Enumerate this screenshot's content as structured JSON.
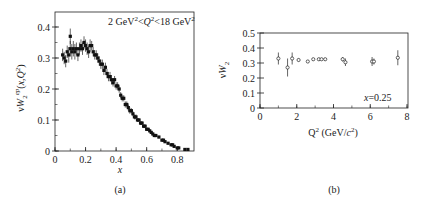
{
  "chart_data": [
    {
      "panel": "(a)",
      "type": "scatter",
      "title": "",
      "annotation": "2 GeV²<Q²<18 GeV²",
      "xlabel": "x",
      "ylabel": "νW₂^ep(x,Q²)",
      "xlim": [
        0,
        0.9
      ],
      "ylim": [
        0,
        0.44
      ],
      "xticks": [
        0,
        0.2,
        0.4,
        0.6,
        0.8
      ],
      "xtick_labels": [
        "0",
        "0.2",
        "0.4",
        "0.6",
        "0.8"
      ],
      "yticks": [
        0,
        0.1,
        0.2,
        0.3,
        0.4
      ],
      "ytick_labels": [
        "0",
        "0.1",
        "0.2",
        "0.3",
        "0.4"
      ],
      "grid": false,
      "series": [
        {
          "name": "νW2 ep",
          "x": [
            0.05,
            0.06,
            0.07,
            0.08,
            0.09,
            0.1,
            0.1,
            0.11,
            0.12,
            0.13,
            0.14,
            0.15,
            0.16,
            0.17,
            0.18,
            0.19,
            0.2,
            0.21,
            0.22,
            0.23,
            0.24,
            0.25,
            0.26,
            0.27,
            0.28,
            0.29,
            0.3,
            0.31,
            0.32,
            0.33,
            0.34,
            0.35,
            0.36,
            0.37,
            0.38,
            0.39,
            0.4,
            0.41,
            0.42,
            0.43,
            0.44,
            0.45,
            0.46,
            0.47,
            0.48,
            0.49,
            0.5,
            0.51,
            0.52,
            0.53,
            0.54,
            0.55,
            0.56,
            0.57,
            0.58,
            0.59,
            0.6,
            0.61,
            0.62,
            0.63,
            0.64,
            0.65,
            0.66,
            0.68,
            0.7,
            0.71,
            0.72,
            0.74,
            0.76,
            0.77,
            0.78,
            0.8,
            0.81,
            0.85,
            0.87
          ],
          "y": [
            0.31,
            0.3,
            0.29,
            0.32,
            0.31,
            0.33,
            0.37,
            0.32,
            0.33,
            0.32,
            0.33,
            0.31,
            0.33,
            0.34,
            0.33,
            0.35,
            0.34,
            0.33,
            0.32,
            0.34,
            0.34,
            0.32,
            0.31,
            0.31,
            0.3,
            0.29,
            0.28,
            0.28,
            0.26,
            0.27,
            0.25,
            0.24,
            0.24,
            0.23,
            0.22,
            0.23,
            0.21,
            0.21,
            0.2,
            0.18,
            0.17,
            0.17,
            0.15,
            0.15,
            0.14,
            0.13,
            0.13,
            0.12,
            0.11,
            0.11,
            0.1,
            0.1,
            0.09,
            0.09,
            0.08,
            0.08,
            0.07,
            0.07,
            0.065,
            0.06,
            0.055,
            0.05,
            0.05,
            0.045,
            0.035,
            0.035,
            0.03,
            0.025,
            0.02,
            0.02,
            0.015,
            0.01,
            0.01,
            0.005,
            0.005
          ],
          "err": [
            0.02,
            0.02,
            0.02,
            0.02,
            0.025,
            0.025,
            0.025,
            0.025,
            0.025,
            0.025,
            0.02,
            0.02,
            0.02,
            0.02,
            0.02,
            0.02,
            0.02,
            0.02,
            0.02,
            0.02,
            0.015,
            0.015,
            0.015,
            0.015,
            0.015,
            0.015,
            0.015,
            0.015,
            0.015,
            0.015,
            0.015,
            0.015,
            0.015,
            0.015,
            0.012,
            0.012,
            0.012,
            0.012,
            0.012,
            0.01,
            0.01,
            0.01,
            0.01,
            0.01,
            0.01,
            0.01,
            0.008,
            0.008,
            0.008,
            0.008,
            0.006,
            0.006,
            0.006,
            0.006,
            0.006,
            0.006,
            0.005,
            0.005,
            0.005,
            0.005,
            0.005,
            0.005,
            0.005,
            0.004,
            0.004,
            0.004,
            0.004,
            0.003,
            0.003,
            0.003,
            0.003,
            0.003,
            0.003,
            0.002,
            0.002
          ]
        }
      ]
    },
    {
      "panel": "(b)",
      "type": "scatter",
      "title": "",
      "annotation": "x=0.25",
      "xlabel": "Q² (GeV/c²)",
      "ylabel": "νW₂",
      "xlim": [
        0,
        8
      ],
      "ylim": [
        0,
        0.5
      ],
      "xticks": [
        0,
        2,
        4,
        6,
        8
      ],
      "xtick_labels": [
        "0",
        "2",
        "4",
        "6",
        "8"
      ],
      "yticks": [
        0,
        0.1,
        0.2,
        0.3,
        0.4,
        0.5
      ],
      "ytick_labels": [
        "0",
        "0.1",
        "0.2",
        "0.3",
        "0.4",
        "0.5"
      ],
      "grid": false,
      "series": [
        {
          "name": "νW2 at x=0.25",
          "x": [
            1.0,
            1.5,
            1.75,
            2.1,
            2.6,
            2.9,
            3.2,
            3.35,
            3.55,
            4.5,
            4.65,
            6.1,
            6.2,
            7.5
          ],
          "y": [
            0.33,
            0.27,
            0.33,
            0.32,
            0.31,
            0.325,
            0.325,
            0.325,
            0.325,
            0.325,
            0.305,
            0.31,
            0.31,
            0.335
          ],
          "err": [
            0.04,
            0.06,
            0.04,
            0.01,
            0.005,
            0.008,
            0.008,
            0.008,
            0.008,
            0.015,
            0.025,
            0.03,
            0.02,
            0.05
          ]
        }
      ]
    }
  ],
  "captions": {
    "a": "(a)",
    "b": "(b)"
  }
}
